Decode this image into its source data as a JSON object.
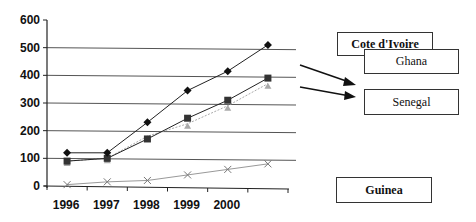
{
  "chart_data": {
    "type": "line",
    "title": "",
    "xlabel": "",
    "ylabel": "",
    "ylim": [
      0,
      600
    ],
    "yticks": [
      0,
      100,
      200,
      300,
      400,
      500,
      600
    ],
    "x": [
      "1996",
      "1997",
      "1998",
      "1999",
      "2000",
      "2001"
    ],
    "xtick_labels": [
      "1996",
      "1997",
      "1998",
      "1999",
      "2000"
    ],
    "grid": true,
    "legend_position": "right (annotation boxes)",
    "series": [
      {
        "name": "Cote d'Ivoire",
        "marker": "diamond",
        "color": "#111111",
        "values": [
          120,
          120,
          230,
          345,
          415,
          510
        ]
      },
      {
        "name": "Ghana",
        "marker": "square",
        "color": "#333333",
        "values": [
          90,
          100,
          170,
          245,
          310,
          390
        ]
      },
      {
        "name": "Senegal",
        "marker": "triangle",
        "color": "#999999",
        "values": [
          90,
          100,
          180,
          225,
          290,
          370
        ]
      },
      {
        "name": "Guinea",
        "marker": "x",
        "color": "#888888",
        "values": [
          5,
          15,
          20,
          40,
          60,
          80
        ]
      }
    ]
  },
  "labels": {
    "cote": "Cote d'Ivoire",
    "ghana": "Ghana",
    "senegal": "Senegal",
    "guinea": "Guinea"
  }
}
